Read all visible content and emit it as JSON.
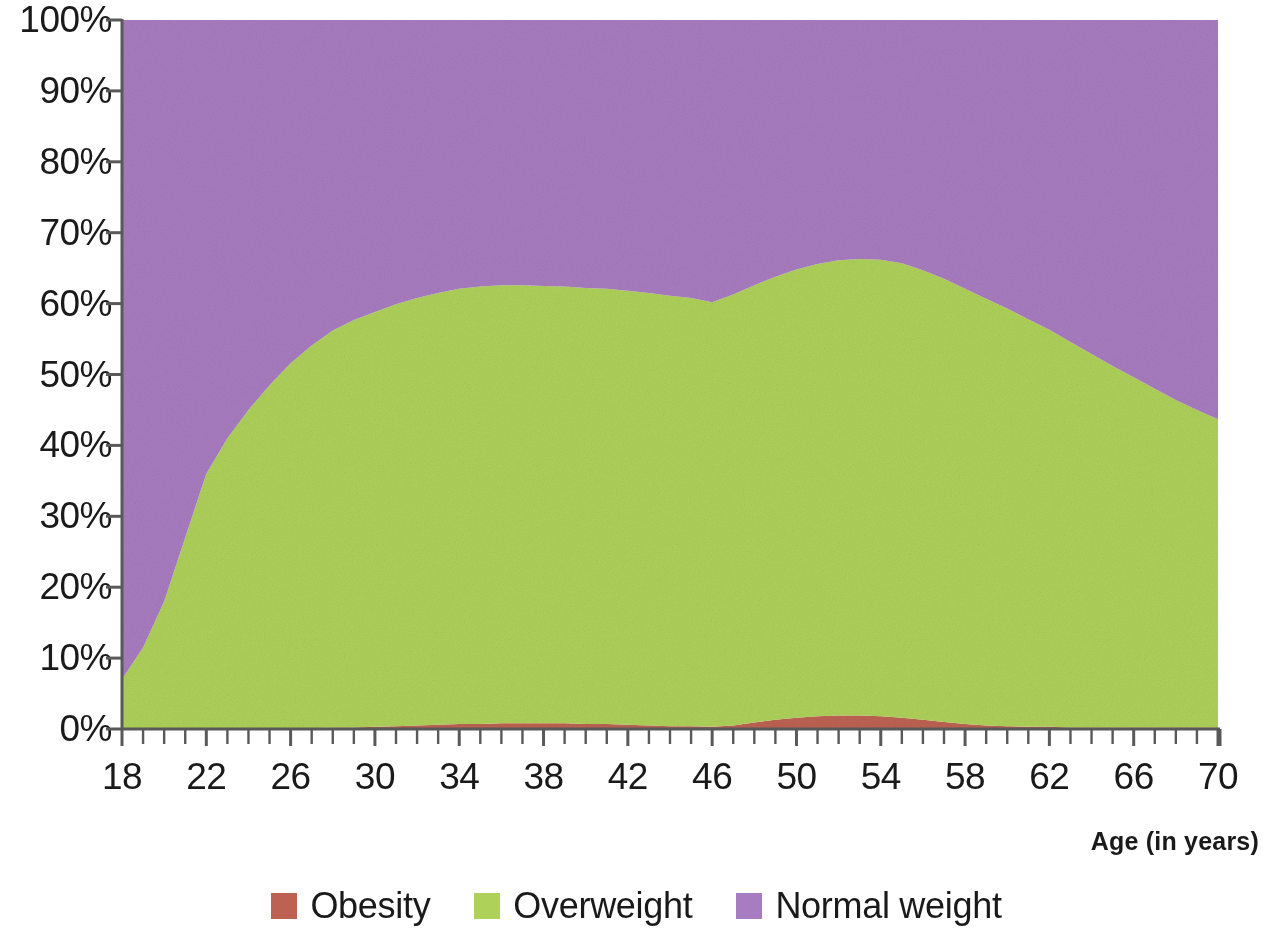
{
  "chart_data": {
    "type": "area",
    "stacked": true,
    "title": "",
    "subtitle": "",
    "xlabel": "Age (in years)",
    "ylabel": "",
    "xlim": [
      18,
      70
    ],
    "ylim": [
      0,
      100
    ],
    "grid": false,
    "legend_position": "bottom",
    "y_tick_labels": [
      "100%",
      "90%",
      "80%",
      "70%",
      "60%",
      "50%",
      "40%",
      "30%",
      "20%",
      "10%",
      "0%"
    ],
    "y_tick_values": [
      100,
      90,
      80,
      70,
      60,
      50,
      40,
      30,
      20,
      10,
      0
    ],
    "x_tick_labels": [
      "18",
      "22",
      "26",
      "30",
      "34",
      "38",
      "42",
      "46",
      "50",
      "54",
      "58",
      "62",
      "66",
      "70"
    ],
    "x_tick_values": [
      18,
      22,
      26,
      30,
      34,
      38,
      42,
      46,
      50,
      54,
      58,
      62,
      66,
      70
    ],
    "x_minor_tick_step": 1,
    "x": [
      18,
      19,
      20,
      21,
      22,
      23,
      24,
      25,
      26,
      27,
      28,
      29,
      30,
      31,
      32,
      33,
      34,
      35,
      36,
      37,
      38,
      39,
      40,
      41,
      42,
      43,
      44,
      45,
      46,
      47,
      48,
      49,
      50,
      51,
      52,
      53,
      54,
      55,
      56,
      57,
      58,
      59,
      60,
      61,
      62,
      63,
      64,
      65,
      66,
      67,
      68,
      69,
      70
    ],
    "series": [
      {
        "name": "Obesity",
        "color": "#bd6252",
        "values": [
          0,
          0,
          0,
          0,
          0,
          0,
          0,
          0,
          0.1,
          0.1,
          0.2,
          0.2,
          0.3,
          0.4,
          0.5,
          0.6,
          0.7,
          0.7,
          0.8,
          0.8,
          0.8,
          0.8,
          0.7,
          0.7,
          0.6,
          0.5,
          0.4,
          0.4,
          0.3,
          0.5,
          0.9,
          1.3,
          1.6,
          1.8,
          1.9,
          1.9,
          1.8,
          1.6,
          1.3,
          1.0,
          0.7,
          0.5,
          0.4,
          0.3,
          0.3,
          0.2,
          0.2,
          0.2,
          0.2,
          0.2,
          0.2,
          0.2,
          0.2
        ]
      },
      {
        "name": "Overweight",
        "color": "#aed159",
        "values": [
          7.0,
          11.5,
          18.0,
          27.0,
          36.0,
          41.0,
          45.0,
          48.5,
          51.5,
          54.0,
          56.0,
          57.5,
          58.5,
          59.5,
          60.3,
          60.9,
          61.4,
          61.7,
          61.8,
          61.8,
          61.7,
          61.6,
          61.5,
          61.4,
          61.2,
          61.0,
          60.7,
          60.4,
          59.9,
          60.8,
          61.7,
          62.5,
          63.2,
          63.8,
          64.2,
          64.4,
          64.4,
          64.1,
          63.4,
          62.5,
          61.4,
          60.2,
          58.9,
          57.5,
          56.0,
          54.4,
          52.7,
          51.0,
          49.4,
          47.8,
          46.2,
          44.8,
          43.5
        ]
      },
      {
        "name": "Normal weight",
        "color": "#a87cc0",
        "values": [
          93.0,
          88.5,
          82.0,
          73.0,
          64.0,
          59.0,
          55.0,
          51.5,
          48.4,
          45.9,
          43.8,
          42.3,
          41.2,
          40.1,
          39.2,
          38.5,
          37.9,
          37.6,
          37.4,
          37.4,
          37.5,
          37.6,
          37.8,
          37.9,
          38.2,
          38.5,
          38.9,
          39.2,
          39.8,
          38.7,
          37.4,
          36.2,
          35.2,
          34.4,
          33.9,
          33.7,
          33.8,
          34.3,
          35.3,
          36.5,
          37.9,
          39.3,
          40.7,
          42.2,
          43.7,
          45.4,
          47.1,
          48.8,
          50.4,
          52.0,
          53.6,
          55.0,
          56.3
        ]
      }
    ]
  },
  "legend": {
    "items": [
      {
        "label": "Obesity",
        "color": "#bd6252"
      },
      {
        "label": "Overweight",
        "color": "#aed159"
      },
      {
        "label": "Normal weight",
        "color": "#a87cc0"
      }
    ]
  },
  "axes": {
    "x_title": "Age (in years)",
    "axis_line_color": "#595959"
  }
}
